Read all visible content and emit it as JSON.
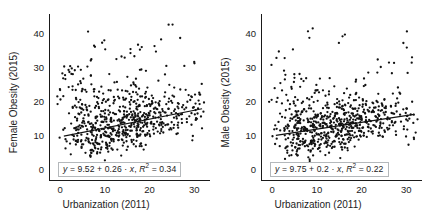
{
  "figure": {
    "width": 424,
    "height": 222,
    "background": "#ffffff",
    "point_color": "#111111",
    "line_color": "#111111",
    "axis_color": "#1a1a1a",
    "eqbox_border": "#b4b8bb"
  },
  "chart_data": [
    {
      "type": "scatter",
      "panel": "left",
      "title": "",
      "xlabel": "Urbanization (2011)",
      "ylabel": "Female Obesity (2015)",
      "xlim": [
        -2.5,
        33.5
      ],
      "ylim": [
        -3.5,
        45.5
      ],
      "xticks": [
        0,
        10,
        20,
        30
      ],
      "yticks": [
        0,
        10,
        20,
        30,
        40
      ],
      "grid": false,
      "legend": "none",
      "annotation": "y = 9.52 + 0.26 · x, R2 = 0.34",
      "fit": {
        "intercept": 9.52,
        "slope": 0.26,
        "r2": 0.34,
        "x_start": 0.6,
        "x_end": 31.5
      },
      "eq_parts": {
        "lhs": "y",
        "eq1": " = 9.52 + 0.26 · ",
        "xvar": "x",
        "sep": ", ",
        "rvar": "R",
        "sup": "2",
        "eq2": " = 0.34"
      },
      "x": [
        0.2,
        0.4,
        0.6,
        0.8,
        1.0,
        1.3,
        1.6,
        1.9,
        2.1,
        2.4,
        2.6,
        2.9,
        3.1,
        3.3,
        3.5,
        3.6,
        3.8,
        3.9,
        4.0,
        4.1,
        4.2,
        4.3,
        4.4,
        4.5,
        4.6,
        4.7,
        4.8,
        4.9,
        5.0,
        5.1,
        5.2,
        5.3,
        5.4,
        5.5,
        5.6,
        5.7,
        5.8,
        5.9,
        6.0,
        6.1,
        6.2,
        6.3,
        6.4,
        6.5,
        6.6,
        6.7,
        6.8,
        6.9,
        7.0,
        7.1,
        7.2,
        7.3,
        7.4,
        7.5,
        7.6,
        7.7,
        7.8,
        7.9,
        8.0,
        8.1,
        8.2,
        8.3,
        8.4,
        8.5,
        8.6,
        8.7,
        8.8,
        8.9,
        9.0,
        9.1,
        9.2,
        9.3,
        9.4,
        9.5,
        9.6,
        9.7,
        9.8,
        9.9,
        10.0,
        10.1,
        10.2,
        10.3,
        10.4,
        10.5,
        10.6,
        10.7,
        10.8,
        10.9,
        11.0,
        11.1,
        11.2,
        11.3,
        11.4,
        11.5,
        11.6,
        11.7,
        11.8,
        11.9,
        12.0,
        12.1,
        12.2,
        12.3,
        12.4,
        12.5,
        12.6,
        12.7,
        12.8,
        12.9,
        13.0,
        13.1,
        13.2,
        13.3,
        13.4,
        13.5,
        13.6,
        13.7,
        13.8,
        13.9,
        14.0,
        14.1,
        14.2,
        14.3,
        14.4,
        14.5,
        14.6,
        14.7,
        14.8,
        14.9,
        15.0,
        15.1,
        15.2,
        15.3,
        15.4,
        15.5,
        15.6,
        15.7,
        15.8,
        15.9,
        16.0,
        16.1,
        16.2,
        16.3,
        16.4,
        16.5,
        16.6,
        16.7,
        16.8,
        16.9,
        17.0,
        17.1,
        17.2,
        17.3,
        17.4,
        17.5,
        17.6,
        17.7,
        17.8,
        17.9,
        18.0,
        18.1,
        18.2,
        18.3,
        18.4,
        18.5,
        18.6,
        18.7,
        18.8,
        18.9,
        19.0,
        19.1,
        19.2,
        19.3,
        19.4,
        19.5,
        19.6,
        19.7,
        19.8,
        19.9,
        20.0,
        20.2,
        20.4,
        20.6,
        20.8,
        21.0,
        21.2,
        21.4,
        21.6,
        21.8,
        22.0,
        22.2,
        22.4,
        22.6,
        22.8,
        23.0,
        23.2,
        23.4,
        23.6,
        23.8,
        24.0,
        24.2,
        24.4,
        24.6,
        24.8,
        25.0,
        25.2,
        25.4,
        25.6,
        25.8,
        26.0,
        26.3,
        26.6,
        26.9,
        27.2,
        27.5,
        27.8,
        28.1,
        28.4,
        28.7,
        29.0,
        29.3,
        29.6,
        29.9,
        30.2,
        30.5,
        30.8,
        31.1,
        31.4
      ],
      "y": [
        27.5,
        23.5,
        21.0,
        9.0,
        11.5,
        25.0,
        30.0,
        13.0,
        18.5,
        7.5,
        12.0,
        28.0,
        22.5,
        27.5,
        9.5,
        16.0,
        11.0,
        6.5,
        20.0,
        13.5,
        8.0,
        27.5,
        10.5,
        14.5,
        17.0,
        7.0,
        12.5,
        24.0,
        9.0,
        19.5,
        6.0,
        15.0,
        11.5,
        30.5,
        8.5,
        13.0,
        21.5,
        10.0,
        5.5,
        16.5,
        12.0,
        26.5,
        9.5,
        14.0,
        7.5,
        18.0,
        11.0,
        22.0,
        6.5,
        13.5,
        9.0,
        17.5,
        37.0,
        10.5,
        15.5,
        8.0,
        12.5,
        20.5,
        6.0,
        14.5,
        11.0,
        23.5,
        9.5,
        7.0,
        16.0,
        13.0,
        10.0,
        18.5,
        5.5,
        12.0,
        15.0,
        8.5,
        21.0,
        11.5,
        9.0,
        14.0,
        6.5,
        17.0,
        13.5,
        38.5,
        10.5,
        12.5,
        8.0,
        19.0,
        15.5,
        11.0,
        7.5,
        16.5,
        13.0,
        9.5,
        22.5,
        12.0,
        14.5,
        6.0,
        18.0,
        10.0,
        11.5,
        25.5,
        8.5,
        15.0,
        13.5,
        20.0,
        9.0,
        12.0,
        16.0,
        7.0,
        14.0,
        11.0,
        31.0,
        17.5,
        10.5,
        13.0,
        8.0,
        19.5,
        15.0,
        12.5,
        9.5,
        23.0,
        11.5,
        16.5,
        6.5,
        14.0,
        13.0,
        21.0,
        10.0,
        18.0,
        12.0,
        33.0,
        15.5,
        9.0,
        17.0,
        11.5,
        26.0,
        13.5,
        8.5,
        20.0,
        14.5,
        12.0,
        16.0,
        10.5,
        22.5,
        13.0,
        18.5,
        11.0,
        15.0,
        35.5,
        9.5,
        17.5,
        12.5,
        19.0,
        14.0,
        10.0,
        24.0,
        16.5,
        11.5,
        13.5,
        20.5,
        8.5,
        15.5,
        12.0,
        18.0,
        28.5,
        10.5,
        14.5,
        16.0,
        13.0,
        21.5,
        11.0,
        17.0,
        9.5,
        19.5,
        15.0,
        12.5,
        23.5,
        14.0,
        10.0,
        18.5,
        16.5,
        13.5,
        20.0,
        11.5,
        15.5,
        17.5,
        12.0,
        36.0,
        14.5,
        19.0,
        16.0,
        13.0,
        21.0,
        10.5,
        17.0,
        15.0,
        12.5,
        27.5,
        18.0,
        14.0,
        19.5,
        16.5,
        13.5,
        22.0,
        11.0,
        17.5,
        15.5,
        41.5,
        20.5,
        14.5,
        18.5,
        12.5,
        16.0,
        23.0,
        13.0,
        19.0,
        15.0,
        17.0,
        21.5,
        14.0,
        18.0,
        30.5,
        16.5,
        12.0,
        20.0,
        13.5,
        17.5,
        15.5,
        25.0,
        19.5,
        14.5,
        9.5,
        18.5,
        16.0,
        21.0,
        39.5,
        13.0,
        17.0,
        20.5,
        15.0,
        34.5,
        18.0,
        11.5,
        22.5,
        16.5,
        14.0
      ]
    },
    {
      "type": "scatter",
      "panel": "right",
      "title": "",
      "xlabel": "Urbanization (2011)",
      "ylabel": "Male Obesity (2015)",
      "xlim": [
        -2.5,
        33.5
      ],
      "ylim": [
        -3.5,
        45.5
      ],
      "xticks": [
        0,
        10,
        20,
        30
      ],
      "yticks": [
        0,
        10,
        20,
        30,
        40
      ],
      "grid": false,
      "legend": "none",
      "annotation": "y = 9.75 + 0.2 · x, R2 = 0.22",
      "fit": {
        "intercept": 9.75,
        "slope": 0.2,
        "r2": 0.22,
        "x_start": 0.6,
        "x_end": 31.5
      },
      "eq_parts": {
        "lhs": "y",
        "eq1": " = 9.75 + 0.2 · ",
        "xvar": "x",
        "sep": ", ",
        "rvar": "R",
        "sup": "2",
        "eq2": " = 0.22"
      },
      "x": [
        0.3,
        0.5,
        0.7,
        0.9,
        1.1,
        1.4,
        1.7,
        2.0,
        2.2,
        2.5,
        2.7,
        3.0,
        3.2,
        3.4,
        3.5,
        3.7,
        3.8,
        3.9,
        4.0,
        4.1,
        4.2,
        4.3,
        4.4,
        4.5,
        4.6,
        4.7,
        4.8,
        4.9,
        5.0,
        5.1,
        5.2,
        5.3,
        5.4,
        5.5,
        5.6,
        5.7,
        5.8,
        5.9,
        6.0,
        6.1,
        6.2,
        6.3,
        6.4,
        6.5,
        6.6,
        6.7,
        6.8,
        6.9,
        7.0,
        7.1,
        7.2,
        7.3,
        7.4,
        7.5,
        7.6,
        7.7,
        7.8,
        7.9,
        8.0,
        8.1,
        8.2,
        8.3,
        8.4,
        8.5,
        8.6,
        8.7,
        8.8,
        8.9,
        9.0,
        9.1,
        9.2,
        9.3,
        9.4,
        9.5,
        9.6,
        9.7,
        9.8,
        9.9,
        10.0,
        10.1,
        10.2,
        10.3,
        10.4,
        10.5,
        10.6,
        10.7,
        10.8,
        10.9,
        11.0,
        11.1,
        11.2,
        11.3,
        11.4,
        11.5,
        11.6,
        11.7,
        11.8,
        11.9,
        12.0,
        12.1,
        12.2,
        12.3,
        12.4,
        12.5,
        12.6,
        12.7,
        12.8,
        12.9,
        13.0,
        13.1,
        13.2,
        13.3,
        13.4,
        13.5,
        13.6,
        13.7,
        13.8,
        13.9,
        14.0,
        14.1,
        14.2,
        14.3,
        14.4,
        14.5,
        14.6,
        14.7,
        14.8,
        14.9,
        15.0,
        15.1,
        15.2,
        15.3,
        15.4,
        15.5,
        15.6,
        15.7,
        15.8,
        15.9,
        16.0,
        16.1,
        16.2,
        16.3,
        16.4,
        16.5,
        16.6,
        16.7,
        16.8,
        16.9,
        17.0,
        17.1,
        17.2,
        17.3,
        17.4,
        17.5,
        17.6,
        17.7,
        17.8,
        17.9,
        18.0,
        18.1,
        18.2,
        18.3,
        18.4,
        18.5,
        18.6,
        18.7,
        18.8,
        18.9,
        19.0,
        19.1,
        19.2,
        19.3,
        19.4,
        19.5,
        19.6,
        19.7,
        19.8,
        19.9,
        20.0,
        20.2,
        20.4,
        20.6,
        20.8,
        21.0,
        21.2,
        21.4,
        21.6,
        21.8,
        22.0,
        22.2,
        22.4,
        22.6,
        22.8,
        23.0,
        23.2,
        23.4,
        23.6,
        23.8,
        24.0,
        24.2,
        24.4,
        24.6,
        24.8,
        25.0,
        25.2,
        25.4,
        25.6,
        25.8,
        26.0,
        26.3,
        26.6,
        26.9,
        27.2,
        27.5,
        27.8,
        28.1,
        28.4,
        28.7,
        29.0,
        29.3,
        29.6,
        29.9,
        30.2,
        30.5,
        30.8,
        31.1,
        31.4
      ],
      "y": [
        19.5,
        22.0,
        8.0,
        31.5,
        14.0,
        11.0,
        16.5,
        9.0,
        26.0,
        13.0,
        6.5,
        32.0,
        10.0,
        20.5,
        12.0,
        7.5,
        15.0,
        24.5,
        9.5,
        11.5,
        17.0,
        5.5,
        13.5,
        8.5,
        28.5,
        12.5,
        10.0,
        16.0,
        6.0,
        14.0,
        9.0,
        21.5,
        11.0,
        7.0,
        13.0,
        18.5,
        10.5,
        5.0,
        15.5,
        12.0,
        8.0,
        23.0,
        9.5,
        11.5,
        6.5,
        14.5,
        10.0,
        17.5,
        7.5,
        13.0,
        25.5,
        9.0,
        11.0,
        5.5,
        16.0,
        12.5,
        8.5,
        19.0,
        10.5,
        14.0,
        6.0,
        13.5,
        11.5,
        9.5,
        20.0,
        7.0,
        15.0,
        12.0,
        40.5,
        10.0,
        8.0,
        16.5,
        13.0,
        11.0,
        5.0,
        14.5,
        9.0,
        22.0,
        12.5,
        10.5,
        7.5,
        17.0,
        13.5,
        11.5,
        8.5,
        15.5,
        6.5,
        12.0,
        26.5,
        10.0,
        14.0,
        9.5,
        18.0,
        13.0,
        7.0,
        16.0,
        11.0,
        12.5,
        20.5,
        8.0,
        15.0,
        10.5,
        13.5,
        6.0,
        17.5,
        12.0,
        9.0,
        14.5,
        11.5,
        23.5,
        16.5,
        8.5,
        13.0,
        10.0,
        18.5,
        12.5,
        15.5,
        7.5,
        14.0,
        11.0,
        21.0,
        9.5,
        16.0,
        13.5,
        6.5,
        12.0,
        17.0,
        10.5,
        15.0,
        8.0,
        19.5,
        13.0,
        11.5,
        14.5,
        9.0,
        16.5,
        12.5,
        38.5,
        18.0,
        10.0,
        13.5,
        15.5,
        7.0,
        11.0,
        20.0,
        14.0,
        12.0,
        16.0,
        9.5,
        17.5,
        13.0,
        10.5,
        22.5,
        15.0,
        11.5,
        18.5,
        8.5,
        14.5,
        12.5,
        16.5,
        10.0,
        13.5,
        19.0,
        15.5,
        11.0,
        17.0,
        9.0,
        14.0,
        12.0,
        25.0,
        16.0,
        13.0,
        18.0,
        10.5,
        15.5,
        11.5,
        20.5,
        14.5,
        12.5,
        17.5,
        9.5,
        16.5,
        13.5,
        27.0,
        15.0,
        11.0,
        19.5,
        14.0,
        12.0,
        18.5,
        10.0,
        16.0,
        13.0,
        21.5,
        15.5,
        11.5,
        17.0,
        29.5,
        14.5,
        12.5,
        19.0,
        16.5,
        13.5,
        15.0,
        11.0,
        18.0,
        20.0,
        14.0,
        30.5,
        16.0,
        12.0,
        17.5,
        13.0,
        15.5,
        23.0,
        10.5,
        19.5,
        14.5,
        16.5,
        38.0,
        12.5,
        18.0,
        15.0,
        8.0,
        13.5,
        31.0,
        17.0,
        14.0,
        5.5,
        16.0,
        20.5,
        12.0
      ]
    }
  ]
}
